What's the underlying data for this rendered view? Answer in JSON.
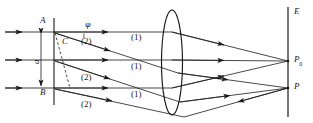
{
  "figure": {
    "type": "optics-ray-diagram",
    "background_color": "#ffffff",
    "ink_color": "#1a1a1a",
    "width": 313,
    "height": 123
  },
  "labels": {
    "slit_top": "A",
    "slit_bottom": "B",
    "foot_of_perpendicular": "C",
    "slit_width": "a",
    "diffraction_angle": "φ",
    "screen": "E",
    "central_point": "P",
    "central_point_subscript": "0",
    "off_axis_point": "P",
    "wavefront_one": "(1)",
    "wavefront_two": "(2)"
  },
  "ray_groups": [
    {
      "name": "group-1-top",
      "label": "(1)",
      "label_x": 138,
      "label_y": 38
    },
    {
      "name": "group-1-middle",
      "label": "(1)",
      "label_x": 138,
      "label_y": 67
    },
    {
      "name": "group-1-bottom",
      "label": "(1)",
      "label_x": 138,
      "label_y": 95
    },
    {
      "name": "group-2-top",
      "label": "(2)",
      "label_x": 88,
      "label_y": 42
    },
    {
      "name": "group-2-middle",
      "label": "(2)",
      "label_x": 88,
      "label_y": 78
    },
    {
      "name": "group-2-bottom",
      "label": "(2)",
      "label_x": 88,
      "label_y": 105
    }
  ],
  "geometry": {
    "slit_plane_x": 54,
    "slit_plane_top_y": 18,
    "slit_plane_bottom_y": 105,
    "slit_top_y": 32,
    "slit_mid_y": 60,
    "slit_bottom_y": 88,
    "lens_center_x": 172,
    "lens_top_y": 10,
    "lens_bottom_y": 115,
    "lens_half_width": 10,
    "screen_x": 288,
    "screen_top_y": 7,
    "screen_bottom_y": 117,
    "focus_P0_y": 61,
    "focus_P_y": 88
  }
}
